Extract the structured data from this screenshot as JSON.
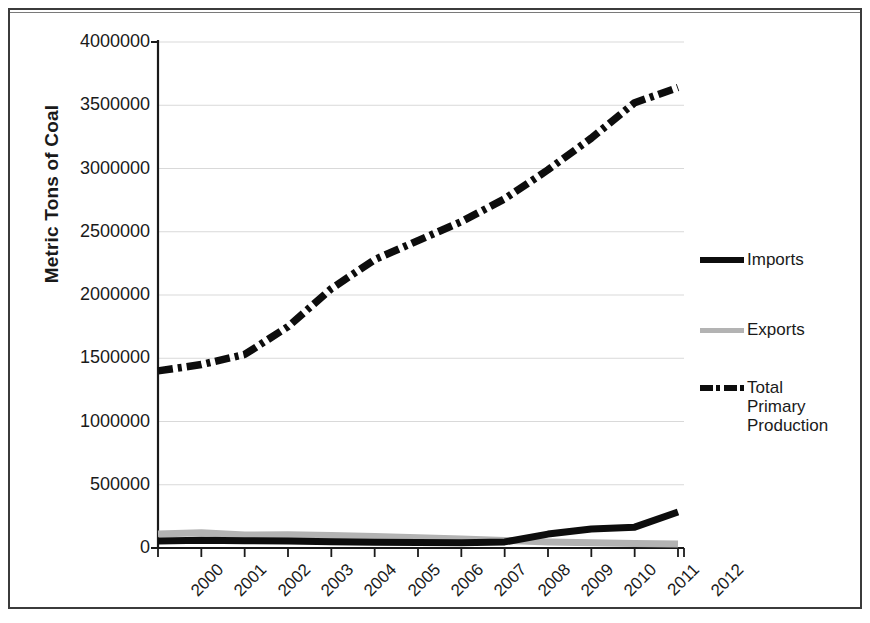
{
  "chart_data": {
    "type": "line",
    "title": "",
    "xlabel": "",
    "ylabel": "Metric Tons of Coal",
    "categories": [
      "2000",
      "2001",
      "2002",
      "2003",
      "2004",
      "2005",
      "2006",
      "2007",
      "2008",
      "2009",
      "2010",
      "2011",
      "2012"
    ],
    "ylim": [
      0,
      4000000
    ],
    "yticks": [
      0,
      500000,
      1000000,
      1500000,
      2000000,
      2500000,
      3000000,
      3500000,
      4000000
    ],
    "ytick_labels": [
      "0",
      "500000",
      "1000000",
      "1500000",
      "2000000",
      "2500000",
      "3000000",
      "3500000",
      "4000000"
    ],
    "grid": true,
    "legend_position": "right",
    "series": [
      {
        "name": "Imports",
        "style": "solid",
        "color": "#0d0d0d",
        "values": [
          55000,
          62000,
          58000,
          55000,
          50000,
          46000,
          44000,
          42000,
          48000,
          110000,
          150000,
          165000,
          285000
        ]
      },
      {
        "name": "Exports",
        "style": "solid",
        "color": "#b3b3b3",
        "values": [
          110000,
          120000,
          102000,
          105000,
          98000,
          90000,
          82000,
          72000,
          60000,
          48000,
          42000,
          36000,
          32000
        ]
      },
      {
        "name": "Total Primary Production",
        "style": "dash-dot",
        "color": "#0d0d0d",
        "values": [
          1400000,
          1450000,
          1530000,
          1750000,
          2050000,
          2280000,
          2430000,
          2580000,
          2760000,
          2990000,
          3240000,
          3520000,
          3640000
        ]
      }
    ]
  },
  "axis": {
    "y_title": "Metric Tons of Coal"
  },
  "legend": {
    "items": [
      {
        "label": "Imports",
        "marker": "solid-line-black"
      },
      {
        "label": "Exports",
        "marker": "solid-line-gray"
      },
      {
        "label": "Total\nPrimary\nProduction",
        "marker": "dash-dot-line-black"
      }
    ],
    "item_labels": [
      "Imports",
      "Exports",
      "Total Primary Production"
    ],
    "tpp_line1": "Total",
    "tpp_line2": "Primary",
    "tpp_line3": "Production"
  },
  "colors": {
    "imports": "#0d0d0d",
    "exports": "#b3b3b3",
    "total_primary_production": "#0d0d0d",
    "axis": "#1a1a1a",
    "grid": "#d9d9d9",
    "frame": "#3b3b3b"
  }
}
